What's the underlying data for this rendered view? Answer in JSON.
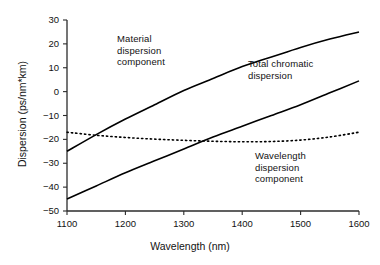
{
  "chart_data": {
    "type": "line",
    "title": "",
    "xlabel": "Wavelength (nm)",
    "ylabel": "Dispersion (ps/nm*km)",
    "xlim": [
      1100,
      1600
    ],
    "ylim": [
      -50,
      30
    ],
    "xticks": [
      1100,
      1200,
      1300,
      1400,
      1500,
      1600
    ],
    "yticks": [
      30,
      20,
      10,
      0,
      -10,
      -20,
      -30,
      -40,
      -50
    ],
    "grid": false,
    "legend": "annotations-inline",
    "x": [
      1100,
      1150,
      1200,
      1250,
      1300,
      1350,
      1400,
      1450,
      1500,
      1550,
      1600
    ],
    "series": [
      {
        "name": "Material dispersion component",
        "style": "solid",
        "color": "#000000",
        "values": [
          -25.0,
          -18.0,
          -11.5,
          -5.5,
          0.5,
          5.5,
          10.5,
          14.5,
          18.5,
          22.0,
          25.0
        ]
      },
      {
        "name": "Total chromatic dispersion",
        "style": "solid",
        "color": "#000000",
        "values": [
          -45.0,
          -39.5,
          -34.0,
          -29.0,
          -24.0,
          -19.0,
          -14.5,
          -10.0,
          -5.5,
          -0.5,
          4.5
        ]
      },
      {
        "name": "Wavelength dispersion component",
        "style": "dotted",
        "color": "#000000",
        "values": [
          -17.0,
          -18.3,
          -19.2,
          -19.9,
          -20.4,
          -20.8,
          -21.0,
          -20.9,
          -20.3,
          -19.0,
          -17.0
        ]
      }
    ],
    "annotations": [
      {
        "id": "material",
        "text": "Material\ndispersion\ncomponent",
        "x": 1190,
        "y": 19
      },
      {
        "id": "total",
        "text": "Total chromatic\ndispersion",
        "x": 1390,
        "y": 11
      },
      {
        "id": "wavelength",
        "text": "Wavelength\ndispersion\ncomponent",
        "x": 1400,
        "y": -27
      }
    ]
  },
  "axes": {
    "x_title": "Wavelength (nm)",
    "y_title": "Dispersion (ps/nm*km)",
    "x_tick_labels": [
      "1100",
      "1200",
      "1300",
      "1400",
      "1500",
      "1600"
    ],
    "y_tick_labels": [
      "30",
      "20",
      "10",
      "0",
      "−10",
      "−20",
      "−30",
      "−40",
      "−50"
    ]
  },
  "annotations": {
    "material": "Material\ndispersion\ncomponent",
    "total": "Total chromatic\ndispersion",
    "wavelength": "Wavelength\ndispersion\ncomponent"
  },
  "colors": {
    "axis": "#2b2b2b",
    "curve": "#000000",
    "background": "#ffffff",
    "text": "#121212"
  }
}
